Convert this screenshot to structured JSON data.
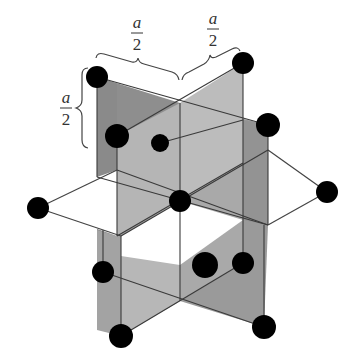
{
  "diagram": {
    "labels": {
      "top_left": {
        "numerator": "a",
        "denominator": "2"
      },
      "top_right": {
        "numerator": "a",
        "denominator": "2"
      },
      "left": {
        "numerator": "a",
        "denominator": "2"
      }
    },
    "colors": {
      "plane_dark": "#8e8e8e",
      "plane_mid": "#a8a8a8",
      "plane_light": "#bdbdbd",
      "atom": "#000000",
      "line": "#444444",
      "background": "#ffffff"
    },
    "atoms": [
      {
        "id": "top-left",
        "x": 97,
        "y": 77,
        "r": 11
      },
      {
        "id": "top-right",
        "x": 243,
        "y": 63,
        "r": 11
      },
      {
        "id": "mid-left",
        "x": 117,
        "y": 136,
        "r": 12
      },
      {
        "id": "mid-right",
        "x": 268,
        "y": 125,
        "r": 12
      },
      {
        "id": "back-center",
        "x": 160,
        "y": 143,
        "r": 9
      },
      {
        "id": "center",
        "x": 180,
        "y": 201,
        "r": 11
      },
      {
        "id": "left",
        "x": 38,
        "y": 208,
        "r": 11
      },
      {
        "id": "right",
        "x": 327,
        "y": 192,
        "r": 11
      },
      {
        "id": "lower-left",
        "x": 103,
        "y": 272,
        "r": 11
      },
      {
        "id": "lower-middle",
        "x": 205,
        "y": 265,
        "r": 13
      },
      {
        "id": "lower-right",
        "x": 243,
        "y": 263,
        "r": 11
      },
      {
        "id": "bottom-left",
        "x": 121,
        "y": 336,
        "r": 12
      },
      {
        "id": "bottom-right",
        "x": 264,
        "y": 327,
        "r": 12
      }
    ]
  }
}
